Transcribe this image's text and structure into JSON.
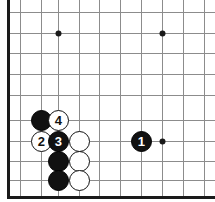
{
  "diagram": {
    "kind": "go-board-diagram",
    "width": 215,
    "height": 202,
    "background_color": "#ffffff",
    "board": {
      "line_color": "#8c8c8c",
      "border_color": "#1a1a1a",
      "border_thickness": 3,
      "line_thickness": 1,
      "vertical_lines_x": [
        8,
        20,
        41,
        58,
        79,
        99,
        120,
        141,
        162,
        183,
        204
      ],
      "horizontal_lines_y": [
        12,
        33,
        53,
        74,
        95,
        120,
        141,
        161,
        180,
        197
      ],
      "left_border_x": 8,
      "bottom_border_y": 197,
      "cropped_edges": [
        "top",
        "right"
      ]
    },
    "star_points": [
      {
        "name": "star-point-upper-left",
        "x": 58,
        "y": 33
      },
      {
        "name": "star-point-upper-right",
        "x": 162,
        "y": 33
      },
      {
        "name": "star-point-lower-right",
        "x": 162,
        "y": 141
      }
    ],
    "star_point_radius": 3,
    "stone_radius": 10.5,
    "colors": {
      "black_stone": "#111111",
      "white_stone": "#ffffff",
      "white_stone_outline": "#111111",
      "black_label_text": "#ffffff",
      "white_label_text": "#111111"
    },
    "stones": [
      {
        "name": "stone-black-corner-upper",
        "color": "black",
        "label": "",
        "x": 41,
        "y": 120
      },
      {
        "name": "stone-white-move-4",
        "color": "white",
        "label": "4",
        "x": 58,
        "y": 120
      },
      {
        "name": "stone-white-move-2",
        "color": "white",
        "label": "2",
        "x": 41,
        "y": 141
      },
      {
        "name": "stone-black-move-3",
        "color": "black",
        "label": "3",
        "x": 58,
        "y": 141
      },
      {
        "name": "stone-white-right-of-3",
        "color": "white",
        "label": "",
        "x": 79,
        "y": 141
      },
      {
        "name": "stone-black-move-1",
        "color": "black",
        "label": "1",
        "x": 141,
        "y": 141
      },
      {
        "name": "stone-black-lower-middle",
        "color": "black",
        "label": "",
        "x": 58,
        "y": 161
      },
      {
        "name": "stone-white-lower-middle",
        "color": "white",
        "label": "",
        "x": 79,
        "y": 161
      },
      {
        "name": "stone-black-lower-bottom",
        "color": "black",
        "label": "",
        "x": 58,
        "y": 180
      },
      {
        "name": "stone-white-lower-bottom",
        "color": "white",
        "label": "",
        "x": 79,
        "y": 180
      }
    ]
  }
}
